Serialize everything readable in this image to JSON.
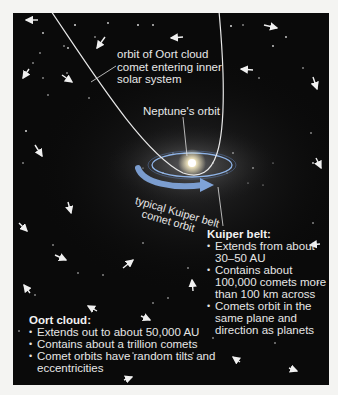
{
  "diagram": {
    "labels": {
      "oort_orbit": [
        "orbit of Oort cloud",
        "comet entering inner",
        "solar system"
      ],
      "neptune_orbit": "Neptune's orbit",
      "kuiper_orbit": [
        "typical Kuiper belt",
        "comet orbit"
      ]
    },
    "kuiper_belt": {
      "title": "Kuiper belt:",
      "bullets": [
        "Extends from about 30–50 AU",
        "Contains about 100,000 comets more than 100 km across",
        "Comets orbit in the same plane and direction as planets"
      ]
    },
    "oort_cloud": {
      "title": "Oort cloud:",
      "bullets": [
        "Extends out to about 50,000 AU",
        "Contains about a trillion comets",
        "Comet orbits have random tilts and eccentricities"
      ]
    },
    "colors": {
      "page_bg": "#f4f4f2",
      "space_bg": "#0a0a0a",
      "text": "#e8e8e8",
      "kuiper_arrow": "#7fa3d8",
      "neptune_orbit": "#8fb4e8",
      "sun": "#fff6d8"
    }
  }
}
